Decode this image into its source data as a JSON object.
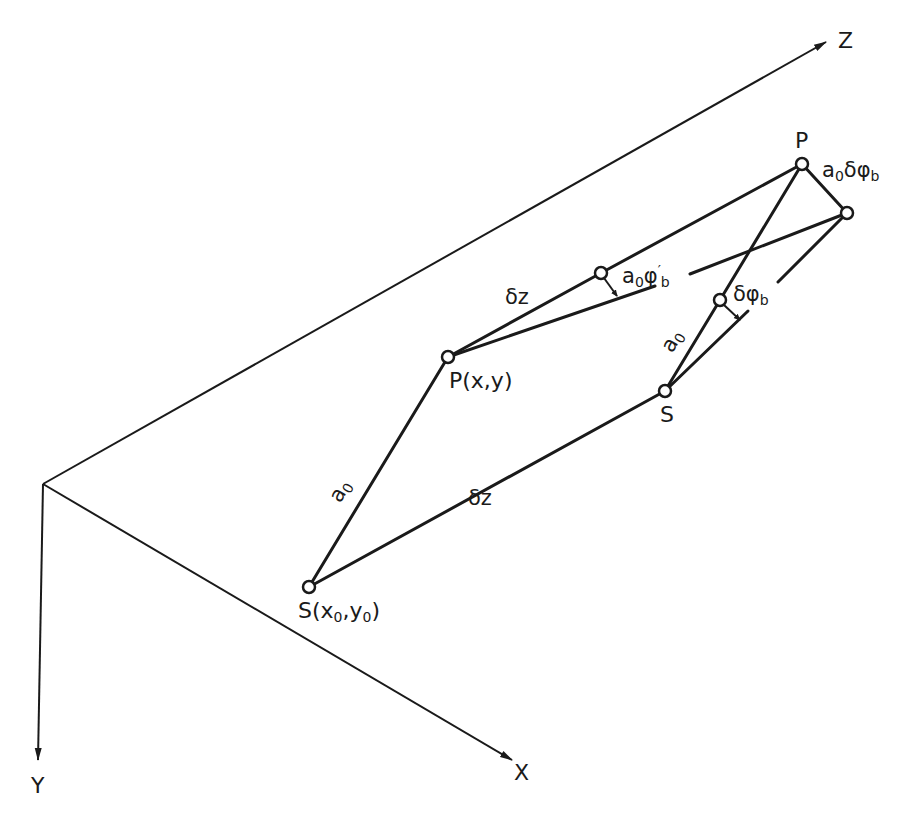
{
  "axes": {
    "x_label": "X",
    "y_label": "Y",
    "z_label": "Z"
  },
  "points": {
    "source_origin": {
      "label": "S(x",
      "sub1": "0",
      "mid": ",y",
      "sub2": "0",
      "end": ")"
    },
    "point_xy": {
      "label": "P(x,y)"
    },
    "source_shifted": {
      "label": "S"
    },
    "point_shifted": {
      "label": "P"
    }
  },
  "edges": {
    "a0_left": {
      "base": "a",
      "sub": "0"
    },
    "dz_bottom": {
      "label": "δz"
    },
    "dz_top": {
      "label": "δz"
    },
    "a0_right": {
      "base": "a",
      "sub": "0"
    },
    "a0_phi_prime": {
      "base": "a",
      "sub": "0",
      "sym": "φ",
      "sup": "′",
      "sub2": "b"
    },
    "dphi_b": {
      "sym": "δφ",
      "sub": "b"
    },
    "a0_dphi_b": {
      "base": "a",
      "sub": "0",
      "sym": "δφ",
      "sub2": "b"
    }
  },
  "colors": {
    "ink": "#1a1a1a",
    "background": "#ffffff"
  }
}
